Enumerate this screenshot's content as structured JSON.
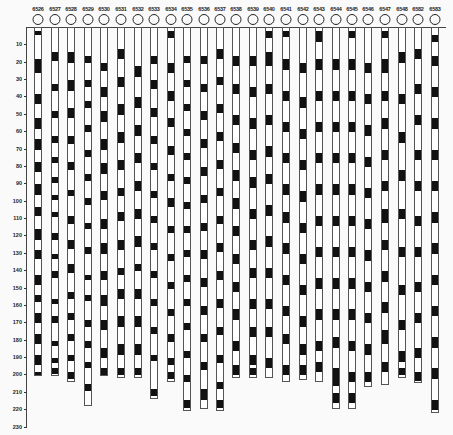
{
  "figure": {
    "type": "stratigraphic column diagram",
    "scale": {
      "unit_px": 1.737,
      "origin_y": 27
    }
  },
  "y_axis": {
    "ticks": [
      "10",
      "20",
      "30",
      "40",
      "50",
      "60",
      "70",
      "80",
      "90",
      "100",
      "110",
      "120",
      "130",
      "140",
      "150",
      "160",
      "170",
      "180",
      "190",
      "200",
      "210",
      "220",
      "230"
    ]
  },
  "columns": [
    {
      "id": "6526",
      "x": 38,
      "bottom": 200,
      "bands": [
        [
          2,
          4
        ],
        [
          18,
          26
        ],
        [
          38,
          44
        ],
        [
          52,
          58
        ],
        [
          64,
          70
        ],
        [
          77,
          83
        ],
        [
          90,
          96
        ],
        [
          103,
          108
        ],
        [
          116,
          122
        ],
        [
          128,
          133
        ],
        [
          142,
          148
        ],
        [
          154,
          158
        ],
        [
          164,
          170
        ],
        [
          176,
          182
        ],
        [
          188,
          194
        ],
        [
          198,
          200
        ]
      ]
    },
    {
      "id": "6527",
      "x": 55,
      "bottom": 200,
      "bands": [
        [
          14,
          19
        ],
        [
          32,
          36
        ],
        [
          48,
          52
        ],
        [
          62,
          66
        ],
        [
          74,
          78
        ],
        [
          86,
          89
        ],
        [
          96,
          99
        ],
        [
          106,
          109
        ],
        [
          118,
          122
        ],
        [
          130,
          133
        ],
        [
          140,
          144
        ],
        [
          156,
          159
        ],
        [
          166,
          170
        ],
        [
          180,
          183
        ],
        [
          190,
          193
        ],
        [
          196,
          199
        ]
      ]
    },
    {
      "id": "6528",
      "x": 71,
      "bottom": 203,
      "bands": [
        [
          14,
          20
        ],
        [
          30,
          36
        ],
        [
          46,
          52
        ],
        [
          62,
          67
        ],
        [
          77,
          82
        ],
        [
          93,
          97
        ],
        [
          108,
          113
        ],
        [
          122,
          127
        ],
        [
          136,
          141
        ],
        [
          152,
          156
        ],
        [
          164,
          168
        ],
        [
          176,
          180
        ],
        [
          188,
          192
        ],
        [
          198,
          202
        ]
      ]
    },
    {
      "id": "6529",
      "x": 88,
      "bottom": 217,
      "bands": [
        [
          16,
          20
        ],
        [
          30,
          34
        ],
        [
          42,
          46
        ],
        [
          56,
          60
        ],
        [
          70,
          74
        ],
        [
          84,
          88
        ],
        [
          98,
          102
        ],
        [
          112,
          116
        ],
        [
          126,
          130
        ],
        [
          142,
          145
        ],
        [
          154,
          157
        ],
        [
          168,
          172
        ],
        [
          180,
          184
        ],
        [
          192,
          196
        ],
        [
          205,
          209
        ]
      ]
    },
    {
      "id": "6530",
      "x": 104,
      "bottom": 200,
      "bands": [
        [
          20,
          25
        ],
        [
          34,
          40
        ],
        [
          48,
          54
        ],
        [
          64,
          70
        ],
        [
          78,
          84
        ],
        [
          94,
          99
        ],
        [
          110,
          116
        ],
        [
          124,
          130
        ],
        [
          140,
          145
        ],
        [
          154,
          160
        ],
        [
          168,
          174
        ],
        [
          184,
          190
        ],
        [
          196,
          200
        ]
      ]
    },
    {
      "id": "6531",
      "x": 121,
      "bottom": 201,
      "bands": [
        [
          12,
          18
        ],
        [
          28,
          34
        ],
        [
          44,
          50
        ],
        [
          60,
          66
        ],
        [
          76,
          82
        ],
        [
          92,
          97
        ],
        [
          106,
          111
        ],
        [
          122,
          128
        ],
        [
          138,
          142
        ],
        [
          150,
          156
        ],
        [
          166,
          172
        ],
        [
          182,
          188
        ],
        [
          196,
          200
        ]
      ]
    },
    {
      "id": "6532",
      "x": 138,
      "bottom": 201,
      "bands": [
        [
          22,
          28
        ],
        [
          40,
          46
        ],
        [
          56,
          62
        ],
        [
          72,
          78
        ],
        [
          88,
          94
        ],
        [
          104,
          110
        ],
        [
          120,
          126
        ],
        [
          136,
          140
        ],
        [
          150,
          156
        ],
        [
          166,
          172
        ],
        [
          182,
          188
        ],
        [
          196,
          200
        ]
      ]
    },
    {
      "id": "6533",
      "x": 154,
      "bottom": 213,
      "bands": [
        [
          16,
          21
        ],
        [
          30,
          35
        ],
        [
          46,
          51
        ],
        [
          62,
          67
        ],
        [
          78,
          82
        ],
        [
          94,
          98
        ],
        [
          108,
          112
        ],
        [
          124,
          128
        ],
        [
          140,
          144
        ],
        [
          156,
          160
        ],
        [
          172,
          176
        ],
        [
          188,
          192
        ],
        [
          208,
          212
        ]
      ]
    },
    {
      "id": "6534",
      "x": 171,
      "bottom": 203,
      "bands": [
        [
          2,
          6
        ],
        [
          20,
          26
        ],
        [
          36,
          42
        ],
        [
          52,
          57
        ],
        [
          68,
          73
        ],
        [
          84,
          88
        ],
        [
          98,
          103
        ],
        [
          114,
          118
        ],
        [
          130,
          134
        ],
        [
          146,
          150
        ],
        [
          162,
          166
        ],
        [
          176,
          181
        ],
        [
          190,
          194
        ],
        [
          198,
          202
        ]
      ]
    },
    {
      "id": "6535",
      "x": 187,
      "bottom": 220,
      "bands": [
        [
          16,
          20
        ],
        [
          30,
          34
        ],
        [
          44,
          48
        ],
        [
          58,
          62
        ],
        [
          72,
          76
        ],
        [
          86,
          90
        ],
        [
          100,
          104
        ],
        [
          114,
          118
        ],
        [
          128,
          132
        ],
        [
          142,
          146
        ],
        [
          156,
          160
        ],
        [
          170,
          174
        ],
        [
          186,
          190
        ],
        [
          200,
          204
        ],
        [
          214,
          219
        ]
      ]
    },
    {
      "id": "6536",
      "x": 204,
      "bottom": 219,
      "bands": [
        [
          16,
          21
        ],
        [
          32,
          37
        ],
        [
          48,
          53
        ],
        [
          64,
          69
        ],
        [
          80,
          85
        ],
        [
          96,
          101
        ],
        [
          112,
          117
        ],
        [
          128,
          133
        ],
        [
          144,
          149
        ],
        [
          160,
          165
        ],
        [
          176,
          181
        ],
        [
          192,
          197
        ],
        [
          208,
          214
        ]
      ]
    },
    {
      "id": "6537",
      "x": 220,
      "bottom": 220,
      "bands": [
        [
          12,
          18
        ],
        [
          28,
          33
        ],
        [
          44,
          49
        ],
        [
          60,
          65
        ],
        [
          76,
          81
        ],
        [
          92,
          97
        ],
        [
          108,
          113
        ],
        [
          124,
          129
        ],
        [
          140,
          145
        ],
        [
          156,
          161
        ],
        [
          172,
          177
        ],
        [
          188,
          193
        ],
        [
          204,
          208
        ],
        [
          214,
          219
        ]
      ]
    },
    {
      "id": "6538",
      "x": 236,
      "bottom": 201,
      "bands": [
        [
          16,
          22
        ],
        [
          32,
          38
        ],
        [
          50,
          56
        ],
        [
          66,
          72
        ],
        [
          82,
          88
        ],
        [
          98,
          104
        ],
        [
          114,
          120
        ],
        [
          130,
          136
        ],
        [
          146,
          152
        ],
        [
          162,
          168
        ],
        [
          180,
          186
        ],
        [
          194,
          200
        ]
      ]
    },
    {
      "id": "6539",
      "x": 253,
      "bottom": 201,
      "bands": [
        [
          16,
          22
        ],
        [
          34,
          40
        ],
        [
          52,
          58
        ],
        [
          70,
          76
        ],
        [
          86,
          92
        ],
        [
          104,
          110
        ],
        [
          122,
          128
        ],
        [
          138,
          144
        ],
        [
          156,
          162
        ],
        [
          172,
          178
        ],
        [
          188,
          194
        ],
        [
          196,
          200
        ]
      ]
    },
    {
      "id": "6540",
      "x": 269,
      "bottom": 201,
      "bands": [
        [
          2,
          6
        ],
        [
          14,
          22
        ],
        [
          32,
          38
        ],
        [
          50,
          56
        ],
        [
          68,
          74
        ],
        [
          84,
          90
        ],
        [
          102,
          108
        ],
        [
          120,
          126
        ],
        [
          138,
          144
        ],
        [
          156,
          162
        ],
        [
          172,
          178
        ],
        [
          190,
          196
        ]
      ]
    },
    {
      "id": "6541",
      "x": 286,
      "bottom": 203,
      "bands": [
        [
          2,
          5
        ],
        [
          18,
          24
        ],
        [
          36,
          42
        ],
        [
          54,
          60
        ],
        [
          72,
          78
        ],
        [
          90,
          96
        ],
        [
          106,
          112
        ],
        [
          124,
          130
        ],
        [
          142,
          148
        ],
        [
          160,
          166
        ],
        [
          176,
          182
        ],
        [
          194,
          200
        ]
      ]
    },
    {
      "id": "6542",
      "x": 303,
      "bottom": 202,
      "bands": [
        [
          20,
          26
        ],
        [
          40,
          46
        ],
        [
          58,
          64
        ],
        [
          76,
          82
        ],
        [
          94,
          100
        ],
        [
          112,
          118
        ],
        [
          130,
          136
        ],
        [
          148,
          154
        ],
        [
          166,
          172
        ],
        [
          182,
          188
        ],
        [
          194,
          200
        ]
      ]
    },
    {
      "id": "6543",
      "x": 319,
      "bottom": 203,
      "bands": [
        [
          2,
          8
        ],
        [
          18,
          24
        ],
        [
          36,
          42
        ],
        [
          54,
          60
        ],
        [
          72,
          78
        ],
        [
          90,
          96
        ],
        [
          108,
          114
        ],
        [
          126,
          132
        ],
        [
          144,
          150
        ],
        [
          162,
          168
        ],
        [
          180,
          186
        ],
        [
          192,
          198
        ]
      ]
    },
    {
      "id": "6544",
      "x": 336,
      "bottom": 219,
      "bands": [
        [
          18,
          24
        ],
        [
          36,
          42
        ],
        [
          54,
          60
        ],
        [
          72,
          78
        ],
        [
          90,
          96
        ],
        [
          108,
          114
        ],
        [
          126,
          132
        ],
        [
          144,
          150
        ],
        [
          162,
          168
        ],
        [
          178,
          184
        ],
        [
          196,
          206
        ],
        [
          210,
          216
        ]
      ]
    },
    {
      "id": "6545",
      "x": 352,
      "bottom": 219,
      "bands": [
        [
          2,
          6
        ],
        [
          18,
          24
        ],
        [
          36,
          42
        ],
        [
          54,
          60
        ],
        [
          72,
          78
        ],
        [
          90,
          96
        ],
        [
          108,
          114
        ],
        [
          126,
          132
        ],
        [
          144,
          150
        ],
        [
          162,
          168
        ],
        [
          180,
          186
        ],
        [
          198,
          204
        ],
        [
          210,
          216
        ]
      ]
    },
    {
      "id": "6546",
      "x": 368,
      "bottom": 206,
      "bands": [
        [
          20,
          26
        ],
        [
          38,
          44
        ],
        [
          56,
          62
        ],
        [
          74,
          80
        ],
        [
          92,
          98
        ],
        [
          110,
          116
        ],
        [
          128,
          134
        ],
        [
          146,
          152
        ],
        [
          164,
          170
        ],
        [
          182,
          188
        ],
        [
          198,
          204
        ]
      ]
    },
    {
      "id": "6547",
      "x": 385,
      "bottom": 205,
      "bands": [
        [
          2,
          6
        ],
        [
          18,
          26
        ],
        [
          36,
          42
        ],
        [
          52,
          58
        ],
        [
          70,
          76
        ],
        [
          88,
          94
        ],
        [
          104,
          112
        ],
        [
          122,
          128
        ],
        [
          140,
          146
        ],
        [
          158,
          164
        ],
        [
          174,
          182
        ],
        [
          192,
          198
        ]
      ]
    },
    {
      "id": "6548",
      "x": 402,
      "bottom": 201,
      "bands": [
        [
          14,
          20
        ],
        [
          38,
          44
        ],
        [
          60,
          66
        ],
        [
          82,
          88
        ],
        [
          104,
          110
        ],
        [
          126,
          132
        ],
        [
          148,
          154
        ],
        [
          168,
          174
        ],
        [
          186,
          192
        ],
        [
          196,
          200
        ]
      ]
    },
    {
      "id": "6582",
      "x": 418,
      "bottom": 204,
      "bands": [
        [
          12,
          18
        ],
        [
          32,
          38
        ],
        [
          50,
          56
        ],
        [
          70,
          76
        ],
        [
          88,
          94
        ],
        [
          108,
          114
        ],
        [
          126,
          132
        ],
        [
          146,
          152
        ],
        [
          164,
          170
        ],
        [
          184,
          190
        ],
        [
          198,
          203
        ]
      ]
    },
    {
      "id": "6583",
      "x": 435,
      "bottom": 221,
      "bands": [
        [
          4,
          8
        ],
        [
          16,
          22
        ],
        [
          34,
          40
        ],
        [
          52,
          58
        ],
        [
          70,
          76
        ],
        [
          88,
          94
        ],
        [
          106,
          112
        ],
        [
          124,
          130
        ],
        [
          142,
          148
        ],
        [
          160,
          166
        ],
        [
          178,
          184
        ],
        [
          196,
          202
        ],
        [
          214,
          220
        ]
      ]
    }
  ]
}
